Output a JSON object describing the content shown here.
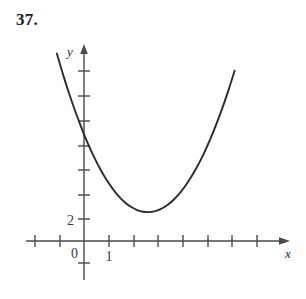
{
  "problem": {
    "number_label": "37."
  },
  "chart_data": {
    "type": "line",
    "title": "",
    "subtitle": "",
    "xlabel": "x",
    "ylabel": "y",
    "curve_kind": "parabola",
    "grid": false,
    "legend": null,
    "annotations": [],
    "axes": {
      "x_axis_label": "x",
      "y_axis_label": "y",
      "origin_label": "0",
      "x_tick_labels": [
        "1"
      ],
      "y_tick_labels": [
        "2"
      ],
      "x_tick_count_left_of_origin": 2,
      "x_tick_count_right_of_origin": 8,
      "y_tick_count_above_origin": 8,
      "y_tick_count_below_origin": 1,
      "x_unit_per_tick": 1,
      "y_unit_per_tick": 2,
      "xlim": [
        -2,
        8
      ],
      "ylim": [
        -2,
        16
      ],
      "x_arrow": true,
      "y_arrow": true
    },
    "points": {
      "y_intercept": {
        "x": 0,
        "y": 9.6
      },
      "vertex": {
        "x": 2.6,
        "y": 3.6
      },
      "left_endpoint": {
        "x": -1.1,
        "y": 15.3
      },
      "right_endpoint": {
        "x": 6.6,
        "y": 15.3
      }
    },
    "x": [
      -1.1,
      -0.85,
      -0.6,
      -0.35,
      -0.1,
      0.0,
      0.15,
      0.4,
      0.65,
      0.9,
      1.15,
      1.4,
      1.65,
      1.9,
      2.15,
      2.4,
      2.6,
      2.85,
      3.1,
      3.35,
      3.6,
      3.85,
      4.1,
      4.35,
      4.6,
      4.85,
      5.1,
      5.35,
      5.6,
      5.85,
      6.1,
      6.35,
      6.6
    ],
    "y": [
      15.3,
      13.6,
      12.02,
      10.57,
      9.23,
      8.71,
      7.99,
      6.89,
      5.9,
      5.04,
      4.3,
      3.67,
      3.17,
      2.79,
      2.53,
      2.39,
      2.36,
      2.42,
      2.6,
      2.9,
      3.31,
      3.84,
      4.49,
      5.26,
      6.14,
      7.14,
      8.26,
      9.5,
      10.85,
      12.32,
      13.91,
      15.62,
      17.45
    ],
    "colors": {
      "curve": "#2b2b2b",
      "axis": "#4a4a4a",
      "background": "#ffffff",
      "text": "#1a1a1a"
    }
  }
}
